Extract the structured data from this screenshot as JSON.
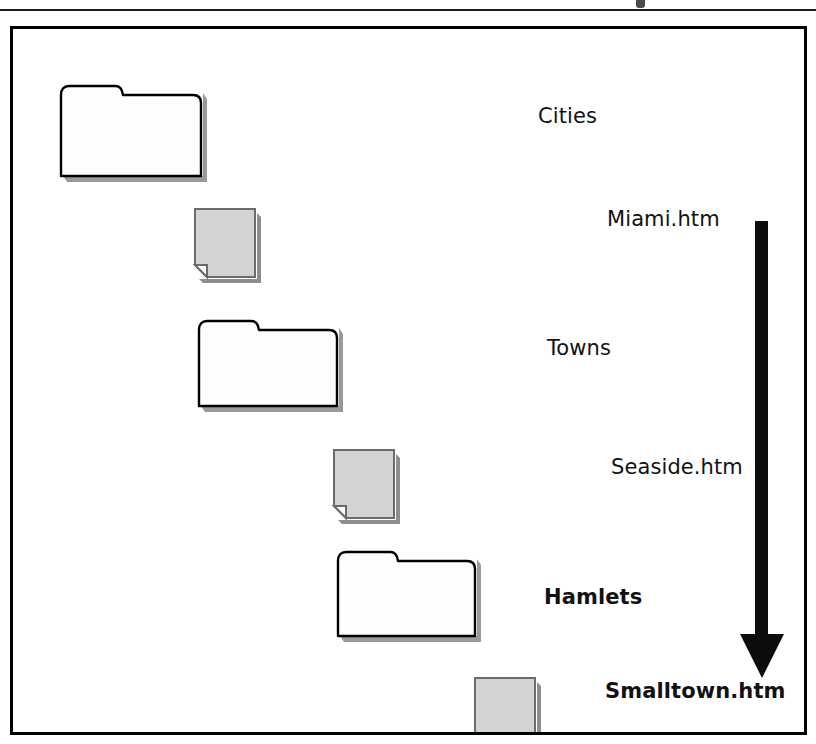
{
  "figure": {
    "frame": {
      "border_color": "#000000",
      "background": "#ffffff"
    },
    "header_rule_color": "#1a1a1a",
    "rows": [
      {
        "icon": "folder-icon",
        "icon_kind": "folder",
        "label": "Cities",
        "bold": false,
        "icon_fill": "#fdfdfd",
        "icon_stroke": "#000000",
        "x": 44,
        "y": 48,
        "w": 146,
        "h": 99,
        "label_x": 525,
        "label_y": 75
      },
      {
        "icon": "document-icon",
        "icon_kind": "document",
        "label": "Miami.htm",
        "bold": false,
        "icon_fill": "#d3d3d3",
        "icon_stroke": "#6b6b6b",
        "x": 180,
        "y": 178,
        "w": 58,
        "h": 66,
        "label_x": 594,
        "label_y": 178
      },
      {
        "icon": "folder-icon",
        "icon_kind": "folder",
        "label": "Towns",
        "bold": false,
        "icon_fill": "#fdfdfd",
        "icon_stroke": "#000000",
        "x": 182,
        "y": 285,
        "w": 146,
        "h": 92,
        "label_x": 534,
        "label_y": 307
      },
      {
        "icon": "document-icon",
        "icon_kind": "document",
        "label": "Seaside.htm",
        "bold": false,
        "icon_fill": "#d3d3d3",
        "icon_stroke": "#6b6b6b",
        "x": 319,
        "y": 419,
        "w": 58,
        "h": 66,
        "label_x": 598,
        "label_y": 426
      },
      {
        "icon": "folder-icon",
        "icon_kind": "folder",
        "label": "Hamlets",
        "bold": true,
        "icon_fill": "#fdfdfd",
        "icon_stroke": "#000000",
        "x": 321,
        "y": 517,
        "w": 145,
        "h": 90,
        "label_x": 531,
        "label_y": 556
      },
      {
        "icon": "document-icon",
        "icon_kind": "document",
        "label": "Smalltown.htm",
        "bold": true,
        "icon_fill": "#d3d3d3",
        "icon_stroke": "#6b6b6b",
        "x": 460,
        "y": 647,
        "w": 58,
        "h": 66,
        "label_x": 592,
        "label_y": 650
      }
    ],
    "arrow": {
      "name": "downward-flow-arrow",
      "color": "#0d0d0d",
      "direction": "down",
      "shaft_width": 13,
      "shaft_height": 413,
      "head_width": 43,
      "head_height": 44
    }
  }
}
